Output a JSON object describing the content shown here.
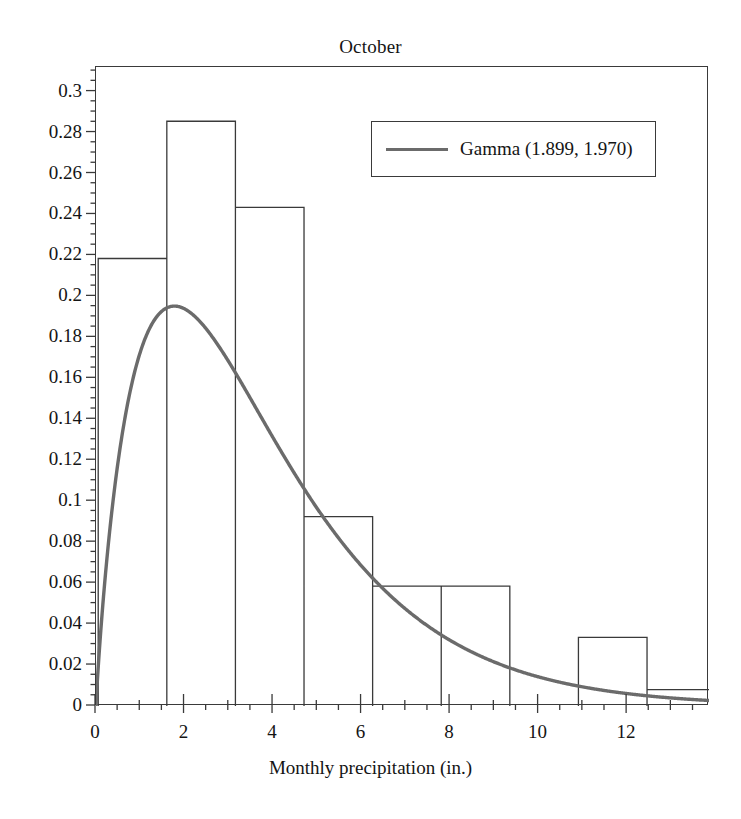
{
  "chart_data": {
    "type": "histogram",
    "title": "October",
    "xlabel": "Monthly precipitation (in.)",
    "ylabel": "",
    "xlim": [
      0,
      13.85
    ],
    "ylim": [
      0,
      0.312
    ],
    "xticks": [
      0,
      2,
      4,
      6,
      8,
      10,
      12
    ],
    "xtick_labels": [
      "0",
      "2",
      "4",
      "6",
      "8",
      "10",
      "12"
    ],
    "yticks": [
      0,
      0.02,
      0.04,
      0.06,
      0.08,
      0.1,
      0.12,
      0.14,
      0.16,
      0.18,
      0.2,
      0.22,
      0.24,
      0.26,
      0.28,
      0.3
    ],
    "ytick_labels": [
      "0",
      "0.02",
      "0.04",
      "0.06",
      "0.08",
      "0.1",
      "0.12",
      "0.14",
      "0.16",
      "0.18",
      "0.2",
      "0.22",
      "0.24",
      "0.26",
      "0.28",
      "0.3"
    ],
    "grid": false,
    "minor_ticks": true,
    "bin_edges": [
      0.05,
      1.6,
      3.15,
      4.7,
      6.25,
      7.8,
      9.35,
      10.9,
      12.45,
      14.0
    ],
    "bin_heights": [
      0.2185,
      0.2855,
      0.2435,
      0.0925,
      0.0585,
      0.0585,
      0.0,
      0.0335,
      0.008
    ],
    "bar_edge_color": "#3a3a3a",
    "bar_fill_color": "#ffffff",
    "series": [
      {
        "name": "Gamma (1.899, 1.970)",
        "type": "line",
        "color": "#6b6b6b",
        "distribution": "gamma",
        "shape": 1.899,
        "scale": 1.97,
        "peak_x": 1.77,
        "peak_y": 0.2985
      }
    ],
    "legend": {
      "position": "upper right",
      "entries": [
        "Gamma (1.899, 1.970)"
      ],
      "box": true
    },
    "annotations": []
  },
  "legend": {
    "label": "Gamma (1.899, 1.970)"
  },
  "axes": {
    "x_title": "Monthly precipitation (in.)"
  }
}
